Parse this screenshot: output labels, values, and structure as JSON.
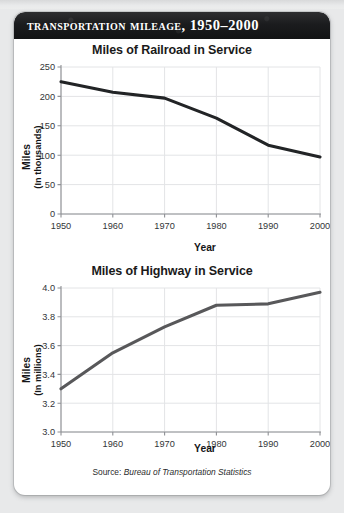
{
  "figure": {
    "banner_title": "Transportation Mileage, 1950–2000",
    "source_prefix": "Source: ",
    "source_name": "Bureau of Transportation Statistics",
    "accent_banner_color": "#1b1c1e",
    "card_background": "#ffffff",
    "page_background": "#e8e9ea"
  },
  "chart_data": [
    {
      "type": "line",
      "id": "railroad",
      "title": "Miles of Railroad in Service",
      "xlabel": "Year",
      "ylabel": "Miles",
      "ylabel_sub": "(In thousands)",
      "x": [
        1950,
        1960,
        1970,
        1980,
        1990,
        2000
      ],
      "xticklabels": [
        "1950",
        "1960",
        "1970",
        "1980",
        "1990",
        "2000"
      ],
      "yticks": [
        0,
        50,
        100,
        150,
        200,
        250
      ],
      "yticklabels": [
        "0",
        "50",
        "100",
        "150",
        "200",
        "250"
      ],
      "ylim": [
        0,
        250
      ],
      "xlim": [
        1950,
        2000
      ],
      "grid": true,
      "legend": "none",
      "series": [
        {
          "name": "Miles of railroad in service",
          "color": "#222426",
          "values": [
            225,
            207,
            197,
            163,
            117,
            97
          ]
        }
      ]
    },
    {
      "type": "line",
      "id": "highway",
      "title": "Miles of Highway in Service",
      "xlabel": "Year",
      "ylabel": "Miles",
      "ylabel_sub": "(In millions)",
      "x": [
        1950,
        1960,
        1970,
        1980,
        1990,
        2000
      ],
      "xticklabels": [
        "1950",
        "1960",
        "1970",
        "1980",
        "1990",
        "2000"
      ],
      "yticks": [
        3.0,
        3.2,
        3.4,
        3.6,
        3.8,
        4.0
      ],
      "yticklabels": [
        "3.0",
        "3.2",
        "3.4",
        "3.6",
        "3.8",
        "4.0"
      ],
      "ylim": [
        3.0,
        4.0
      ],
      "xlim": [
        1950,
        2000
      ],
      "grid": true,
      "legend": "none",
      "series": [
        {
          "name": "Miles of highway in service",
          "color": "#58585a",
          "values": [
            3.3,
            3.55,
            3.73,
            3.88,
            3.89,
            3.97
          ]
        }
      ]
    }
  ]
}
